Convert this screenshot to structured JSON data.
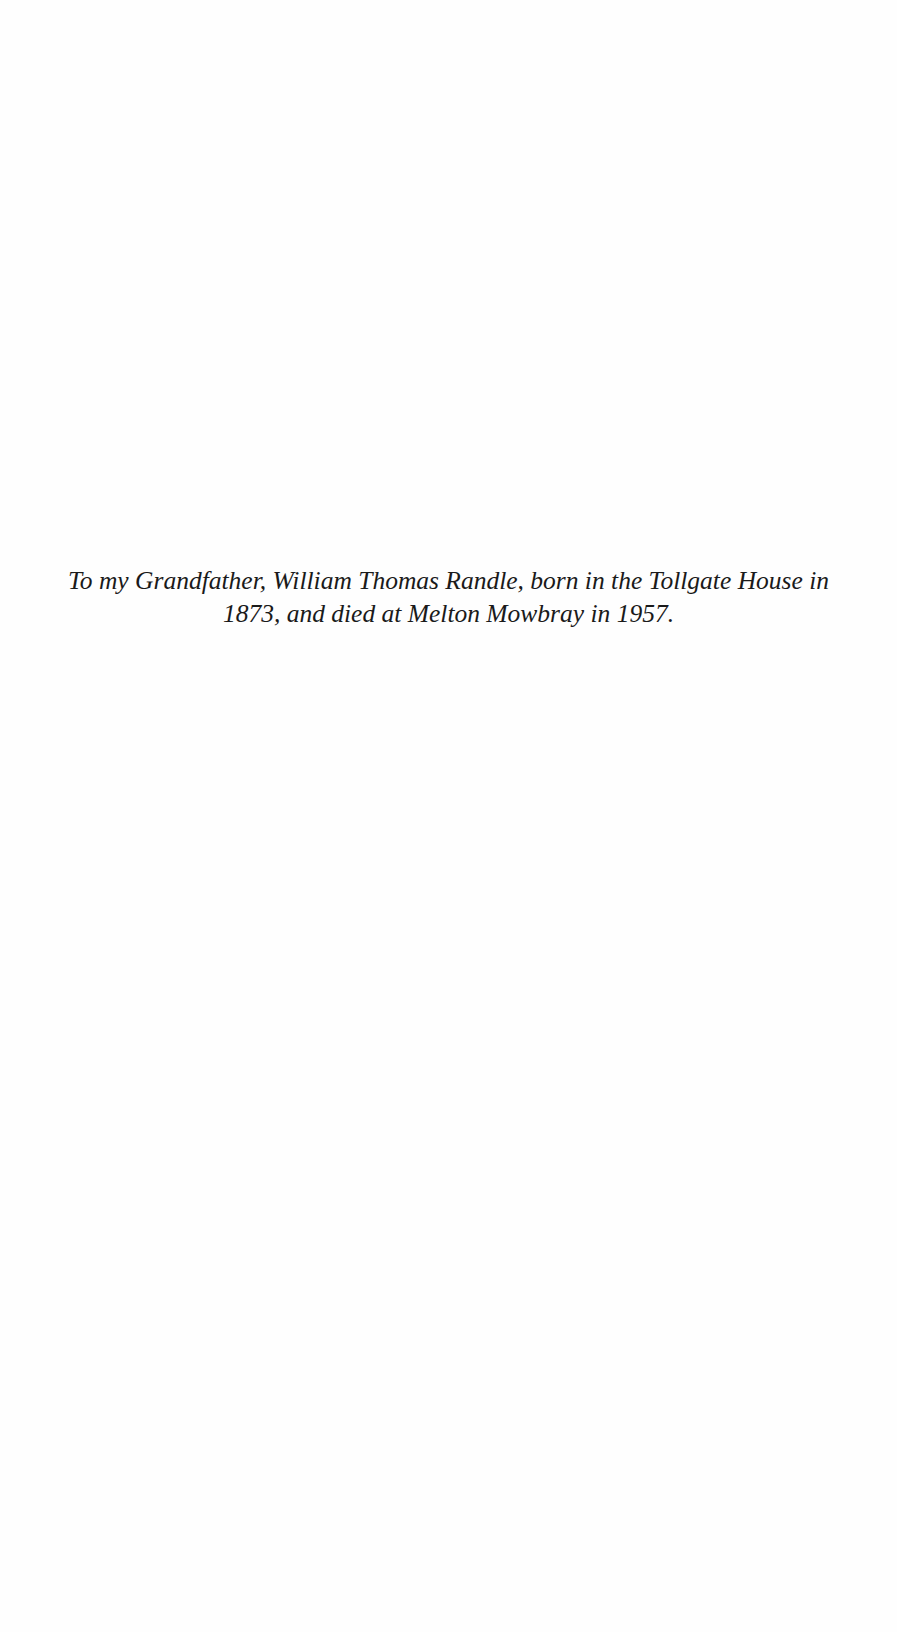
{
  "document": {
    "type": "dedication-page",
    "dedication": {
      "line1": "To my Grandfather, William Thomas Randle, born in the Tollgate House in",
      "line2": "1873, and died at Melton Mowbray in 1957."
    }
  },
  "colors": {
    "background": "#fefefe",
    "text": "#1a1a1a"
  }
}
